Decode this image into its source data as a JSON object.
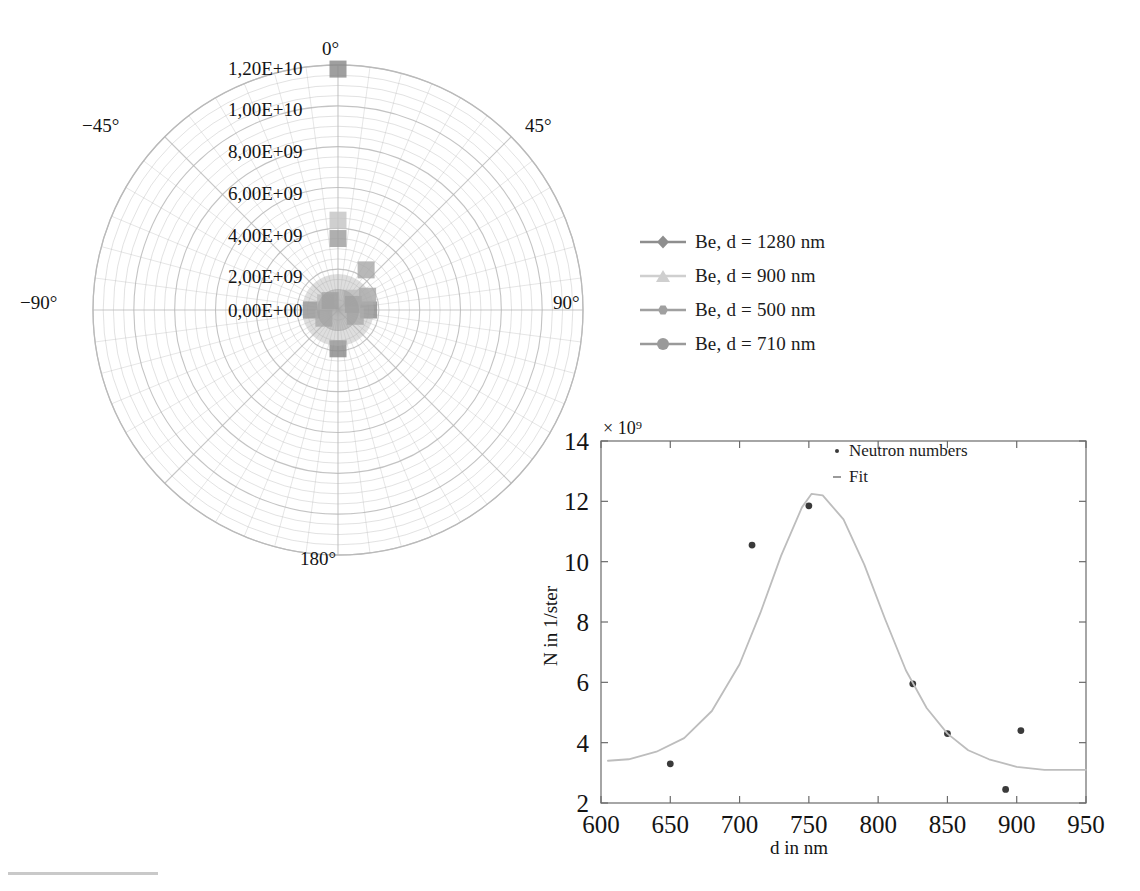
{
  "figure": {
    "background": "#ffffff",
    "grid_color": "#b8b8b8",
    "axis_color": "#555555"
  },
  "polar": {
    "center_label": "polar-neutron-angular-distribution",
    "angle_ticks": [
      {
        "label": "0°",
        "deg": 0
      },
      {
        "label": "45°",
        "deg": 45
      },
      {
        "label": "90°",
        "deg": 90
      },
      {
        "label": "180°",
        "deg": 180
      },
      {
        "label": "−90°",
        "deg": -90
      },
      {
        "label": "−45°",
        "deg": -45
      }
    ],
    "radial_ticks": [
      "0,00E+00",
      "2,00E+09",
      "4,00E+09",
      "6,00E+09",
      "8,00E+09",
      "1,00E+10",
      "1,20E+10"
    ],
    "radial_max": 12000000000,
    "radial_step": 2000000000,
    "spoke_step_deg": 7.5,
    "series": [
      {
        "name": "Be, d = 1280 nm",
        "color": "#8a8a8a",
        "points": [
          {
            "deg": 0,
            "r": 11800000000
          },
          {
            "deg": 90,
            "r": 1500000000
          },
          {
            "deg": -90,
            "r": 1300000000
          },
          {
            "deg": 180,
            "r": 1900000000
          }
        ]
      },
      {
        "name": "Be, d = 900 nm",
        "color": "#c4c4c4",
        "points": [
          {
            "deg": 0,
            "r": 4400000000
          },
          {
            "deg": 50,
            "r": 900000000
          },
          {
            "deg": -60,
            "r": 700000000
          }
        ]
      },
      {
        "name": "Be, d = 500 nm",
        "color": "#9e9e9e",
        "points": [
          {
            "deg": 0,
            "r": 3500000000
          },
          {
            "deg": 70,
            "r": 800000000
          },
          {
            "deg": -40,
            "r": 600000000
          }
        ]
      },
      {
        "name": "Be, d = 710 nm",
        "color": "#a8a8a8",
        "points": [
          {
            "deg": 35,
            "r": 2400000000
          },
          {
            "deg": 65,
            "r": 1600000000
          },
          {
            "deg": 110,
            "r": 900000000
          },
          {
            "deg": -120,
            "r": 800000000
          }
        ]
      }
    ]
  },
  "legend": {
    "items": [
      {
        "label": "Be, d = 1280 nm",
        "color": "#8e8e8e",
        "marker": "diamond"
      },
      {
        "label": "Be, d = 900 nm",
        "color": "#cfcfcf",
        "marker": "triangle"
      },
      {
        "label": "Be, d = 500 nm",
        "color": "#a0a0a0",
        "marker": "hexagon"
      },
      {
        "label": "Be, d = 710 nm",
        "color": "#9a9a9a",
        "marker": "circle"
      }
    ]
  },
  "chart_data": {
    "type": "scatter",
    "title": "",
    "xlabel": "d in nm",
    "ylabel": "N in 1/ster",
    "y_multiplier": "× 10⁹",
    "xlim": [
      600,
      950
    ],
    "ylim": [
      2,
      14
    ],
    "xticks": [
      600,
      650,
      700,
      750,
      800,
      850,
      900,
      950
    ],
    "yticks": [
      2,
      4,
      6,
      8,
      10,
      12,
      14
    ],
    "grid": false,
    "legend_position": "top-right",
    "series": [
      {
        "name": "Neutron numbers",
        "marker": "dot",
        "color": "#3a3a3a",
        "x": [
          650,
          709,
          750,
          825,
          850,
          892,
          903
        ],
        "y": [
          3.3,
          10.55,
          11.85,
          5.95,
          4.3,
          2.45,
          4.4
        ]
      },
      {
        "name": "Fit",
        "marker": "line",
        "color": "#bdbdbd",
        "x": [
          605,
          620,
          640,
          660,
          680,
          700,
          715,
          730,
          745,
          752,
          760,
          775,
          790,
          805,
          820,
          835,
          850,
          865,
          880,
          900,
          920,
          950
        ],
        "y": [
          3.4,
          3.45,
          3.7,
          4.15,
          5.05,
          6.6,
          8.3,
          10.2,
          11.8,
          12.25,
          12.2,
          11.4,
          9.9,
          8.1,
          6.4,
          5.15,
          4.3,
          3.75,
          3.45,
          3.2,
          3.1,
          3.1
        ]
      }
    ]
  },
  "inset_legend": {
    "items": [
      {
        "label": "Neutron numbers",
        "marker": "dot"
      },
      {
        "label": "Fit",
        "marker": "dash"
      }
    ]
  }
}
